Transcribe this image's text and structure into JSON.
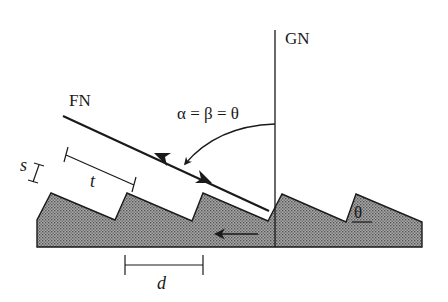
{
  "labels": {
    "ground_normal": "GN",
    "facet_normal": "FN",
    "angle_relation": "α = β = θ",
    "facet_angle": "θ",
    "step_height": "s",
    "facet_width": "t",
    "period": "d"
  },
  "colors": {
    "line": "#1a1a1a",
    "surface_fill": "#9a9a9a",
    "surface_dot": "#5c5c5c",
    "background": "#ffffff"
  },
  "icons": {
    "incident_arrow": "arrowhead-up-left",
    "reflected_arrow": "arrowhead-down-right",
    "angle_arc_arrow": "curved-arrow",
    "motion_arrow": "arrow-left"
  }
}
